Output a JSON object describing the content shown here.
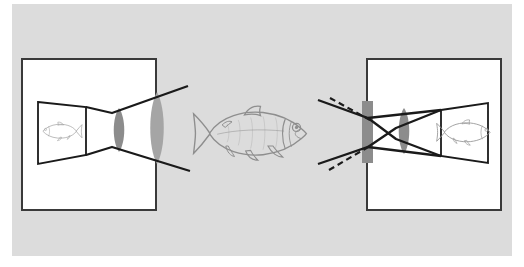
{
  "figure": {
    "name": "optics-imaging-diagram",
    "title": "",
    "caption": "",
    "background_color": "#ffffff",
    "canvas_color": "#dcdcdc",
    "canvas": {
      "x": 12,
      "y": 4,
      "width": 500,
      "height": 252
    },
    "ink_color": "#1a1a1a",
    "element_fill": "#ffffff",
    "optic_color": "#8c8c8c",
    "dashed_color": "#1a1a1a"
  },
  "left_camera": {
    "name": "lens-camera-left",
    "label": "",
    "box": {
      "x": 22,
      "y": 59,
      "width": 134,
      "height": 151,
      "fill": "#ffffff",
      "stroke": "#3a3a3a"
    },
    "screen": {
      "name": "projection-screen-left",
      "points": "38,102 86,107 86,155 38,164",
      "fill": "#ffffff",
      "stroke": "#1a1a1a"
    },
    "image_fish": {
      "name": "inverted-fish-image-left",
      "orientation": "facing-left",
      "center_x": 62,
      "center_y": 131,
      "scale": 0.22,
      "color": "#9a9a9a"
    },
    "inner_lens": {
      "name": "converging-lens-inner-left",
      "center_x": 119,
      "center_y": 130,
      "half_height": 22,
      "bulge": 7,
      "fill": "#8c8c8c"
    },
    "outer_lens": {
      "name": "converging-lens-outer-left",
      "center_x": 157,
      "center_y": 128,
      "half_height": 36,
      "bulge": 9,
      "fill": "#a5a5a5"
    },
    "rays": [
      {
        "name": "ray-upper-left",
        "points": "86,107 112,113 188,86"
      },
      {
        "name": "ray-lower-left",
        "points": "86,155 112,147 190,171"
      }
    ]
  },
  "object_fish": {
    "name": "object-fish-center",
    "orientation": "facing-right",
    "center_x": 250,
    "center_y": 133,
    "scale": 0.62,
    "color": "#8e8e8e",
    "label": ""
  },
  "right_camera": {
    "name": "pinhole-lens-camera-right",
    "label": "",
    "box": {
      "x": 367,
      "y": 59,
      "width": 134,
      "height": 151,
      "fill": "#ffffff",
      "stroke": "#3a3a3a"
    },
    "aperture": {
      "name": "aperture-slit-right",
      "x": 362,
      "y": 101,
      "width": 11,
      "height": 62,
      "fill": "#8c8c8c"
    },
    "inner_lens": {
      "name": "converging-lens-inner-right",
      "center_x": 404,
      "center_y": 131,
      "half_height": 23,
      "bulge": 7,
      "fill": "#8c8c8c"
    },
    "screen": {
      "name": "projection-screen-right",
      "points": "441,110 488,103 488,163 441,156",
      "fill": "#ffffff",
      "stroke": "#1a1a1a"
    },
    "image_fish": {
      "name": "upright-fish-image-right",
      "orientation": "facing-right",
      "center_x": 464,
      "center_y": 132,
      "scale": 0.3,
      "color": "#9a9a9a"
    },
    "rays": [
      {
        "name": "ray-upper-right",
        "points": "318,100 368,118 441,110"
      },
      {
        "name": "ray-lower-right",
        "points": "318,164 368,147 441,156"
      },
      {
        "name": "ray-cross-upper-right",
        "points": "368,118 396,139 441,156"
      },
      {
        "name": "ray-cross-lower-right",
        "points": "368,147 396,128 441,110"
      }
    ],
    "dashed_rays": [
      {
        "name": "dashed-ray-upper-right",
        "points": "330,98 370,120"
      },
      {
        "name": "dashed-ray-lower-right",
        "points": "329,170 370,146"
      }
    ]
  }
}
